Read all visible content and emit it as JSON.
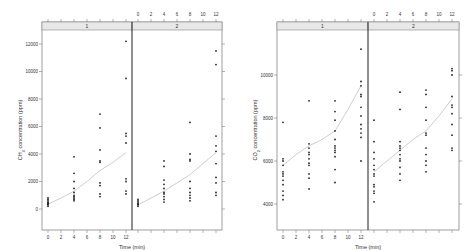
{
  "chart_data": [
    {
      "type": "scatter",
      "title": "",
      "xlabel": "Time (min)",
      "ylabel": "CH4 concentration (ppm)",
      "ylabel_parts": {
        "pre": "CH",
        "sub": "4",
        "post": " concentration (ppm)"
      },
      "ylim": [
        -500,
        13000
      ],
      "xlim": [
        -1,
        13
      ],
      "yticks": [
        0,
        2000,
        4000,
        6000,
        8000,
        10000,
        12000
      ],
      "ytick_labels": [
        "0",
        "2000",
        "4000",
        "6000",
        "8000",
        "10000",
        "12000"
      ],
      "xticks": [
        0,
        2,
        4,
        6,
        8,
        10,
        12
      ],
      "xtick_labels": [
        "0",
        "2",
        "4",
        "6",
        "8",
        "10",
        "12"
      ],
      "grid": false,
      "panels": [
        {
          "strip_label": "1",
          "points": [
            [
              0,
              200
            ],
            [
              0,
              300
            ],
            [
              0,
              400
            ],
            [
              0,
              500
            ],
            [
              0,
              600
            ],
            [
              0,
              700
            ],
            [
              0,
              800
            ],
            [
              0,
              350
            ],
            [
              0,
              450
            ],
            [
              4,
              600
            ],
            [
              4,
              800
            ],
            [
              4,
              1000
            ],
            [
              4,
              1200
            ],
            [
              4,
              1500
            ],
            [
              4,
              2000
            ],
            [
              4,
              2600
            ],
            [
              4,
              3800
            ],
            [
              4,
              700
            ],
            [
              4,
              900
            ],
            [
              8,
              900
            ],
            [
              8,
              1100
            ],
            [
              8,
              1700
            ],
            [
              8,
              1900
            ],
            [
              8,
              3400
            ],
            [
              8,
              3500
            ],
            [
              8,
              4300
            ],
            [
              8,
              5900
            ],
            [
              8,
              6900
            ],
            [
              12,
              1100
            ],
            [
              12,
              1300
            ],
            [
              12,
              2000
            ],
            [
              12,
              2200
            ],
            [
              12,
              4800
            ],
            [
              12,
              5300
            ],
            [
              12,
              5500
            ],
            [
              12,
              9500
            ],
            [
              12,
              12200
            ]
          ],
          "smooth": [
            [
              0,
              350
            ],
            [
              2,
              800
            ],
            [
              4,
              1300
            ],
            [
              6,
              2000
            ],
            [
              8,
              2800
            ],
            [
              10,
              3400
            ],
            [
              12,
              4100
            ]
          ]
        },
        {
          "strip_label": "2",
          "points": [
            [
              0,
              200
            ],
            [
              0,
              300
            ],
            [
              0,
              400
            ],
            [
              0,
              500
            ],
            [
              0,
              600
            ],
            [
              0,
              700
            ],
            [
              0,
              350
            ],
            [
              4,
              500
            ],
            [
              4,
              700
            ],
            [
              4,
              900
            ],
            [
              4,
              1100
            ],
            [
              4,
              1200
            ],
            [
              4,
              1500
            ],
            [
              4,
              1800
            ],
            [
              4,
              2100
            ],
            [
              4,
              3100
            ],
            [
              4,
              3500
            ],
            [
              8,
              600
            ],
            [
              8,
              800
            ],
            [
              8,
              1000
            ],
            [
              8,
              1200
            ],
            [
              8,
              1500
            ],
            [
              8,
              2000
            ],
            [
              8,
              3500
            ],
            [
              8,
              3600
            ],
            [
              8,
              4000
            ],
            [
              8,
              6300
            ],
            [
              12,
              1000
            ],
            [
              12,
              1200
            ],
            [
              12,
              1900
            ],
            [
              12,
              2300
            ],
            [
              12,
              3300
            ],
            [
              12,
              4200
            ],
            [
              12,
              4600
            ],
            [
              12,
              5300
            ],
            [
              12,
              10500
            ],
            [
              12,
              11500
            ]
          ],
          "smooth": [
            [
              0,
              300
            ],
            [
              2,
              800
            ],
            [
              4,
              1300
            ],
            [
              6,
              1900
            ],
            [
              8,
              2500
            ],
            [
              10,
              3300
            ],
            [
              12,
              4100
            ]
          ]
        }
      ]
    },
    {
      "type": "scatter",
      "title": "",
      "xlabel": "Time (min)",
      "ylabel": "CO2 concentration (ppm)",
      "ylabel_parts": {
        "pre": "CO",
        "sub": "2",
        "post": " concentration (ppm)"
      },
      "ylim": [
        3300,
        12000
      ],
      "xlim": [
        -1,
        13
      ],
      "yticks": [
        4000,
        6000,
        8000,
        10000
      ],
      "ytick_labels": [
        "4000",
        "6000",
        "8000",
        "10000"
      ],
      "xticks": [
        0,
        2,
        4,
        6,
        8,
        10,
        12
      ],
      "xtick_labels": [
        "0",
        "2",
        "4",
        "6",
        "8",
        "10",
        "12"
      ],
      "grid": false,
      "panels": [
        {
          "strip_label": "1",
          "points": [
            [
              0,
              4200
            ],
            [
              0,
              4400
            ],
            [
              0,
              4600
            ],
            [
              0,
              4900
            ],
            [
              0,
              5100
            ],
            [
              0,
              5300
            ],
            [
              0,
              5400
            ],
            [
              0,
              5500
            ],
            [
              0,
              5800
            ],
            [
              0,
              6000
            ],
            [
              0,
              6100
            ],
            [
              0,
              7800
            ],
            [
              4,
              4700
            ],
            [
              4,
              5200
            ],
            [
              4,
              5400
            ],
            [
              4,
              5800
            ],
            [
              4,
              5900
            ],
            [
              4,
              6100
            ],
            [
              4,
              6300
            ],
            [
              4,
              6400
            ],
            [
              4,
              6600
            ],
            [
              4,
              6800
            ],
            [
              4,
              8800
            ],
            [
              8,
              5000
            ],
            [
              8,
              5600
            ],
            [
              8,
              6200
            ],
            [
              8,
              6400
            ],
            [
              8,
              6500
            ],
            [
              8,
              6600
            ],
            [
              8,
              6700
            ],
            [
              8,
              7000
            ],
            [
              8,
              7400
            ],
            [
              8,
              7900
            ],
            [
              8,
              8300
            ],
            [
              8,
              8800
            ],
            [
              12,
              6000
            ],
            [
              12,
              7100
            ],
            [
              12,
              7300
            ],
            [
              12,
              7500
            ],
            [
              12,
              7700
            ],
            [
              12,
              8100
            ],
            [
              12,
              8500
            ],
            [
              12,
              9000
            ],
            [
              12,
              9100
            ],
            [
              12,
              9500
            ],
            [
              12,
              9700
            ],
            [
              12,
              11200
            ]
          ],
          "smooth": [
            [
              0,
              5800
            ],
            [
              2,
              6300
            ],
            [
              4,
              6700
            ],
            [
              6,
              7000
            ],
            [
              8,
              7400
            ],
            [
              10,
              8400
            ],
            [
              12,
              9500
            ]
          ]
        },
        {
          "strip_label": "2",
          "points": [
            [
              0,
              4100
            ],
            [
              0,
              4500
            ],
            [
              0,
              4600
            ],
            [
              0,
              4800
            ],
            [
              0,
              4900
            ],
            [
              0,
              5300
            ],
            [
              0,
              5400
            ],
            [
              0,
              5600
            ],
            [
              0,
              5800
            ],
            [
              0,
              6100
            ],
            [
              0,
              6400
            ],
            [
              0,
              6900
            ],
            [
              0,
              7900
            ],
            [
              4,
              5100
            ],
            [
              4,
              5400
            ],
            [
              4,
              5700
            ],
            [
              4,
              6000
            ],
            [
              4,
              6100
            ],
            [
              4,
              6300
            ],
            [
              4,
              6500
            ],
            [
              4,
              6600
            ],
            [
              4,
              6700
            ],
            [
              4,
              6900
            ],
            [
              4,
              8400
            ],
            [
              4,
              9200
            ],
            [
              8,
              5500
            ],
            [
              8,
              5800
            ],
            [
              8,
              6000
            ],
            [
              8,
              6300
            ],
            [
              8,
              6600
            ],
            [
              8,
              7200
            ],
            [
              8,
              7300
            ],
            [
              8,
              7900
            ],
            [
              8,
              8500
            ],
            [
              8,
              9100
            ],
            [
              8,
              9300
            ],
            [
              12,
              6500
            ],
            [
              12,
              6600
            ],
            [
              12,
              7200
            ],
            [
              12,
              7700
            ],
            [
              12,
              8200
            ],
            [
              12,
              8500
            ],
            [
              12,
              8600
            ],
            [
              12,
              9000
            ],
            [
              12,
              10000
            ],
            [
              12,
              10200
            ],
            [
              12,
              10300
            ]
          ],
          "smooth": [
            [
              0,
              5500
            ],
            [
              2,
              6000
            ],
            [
              4,
              6500
            ],
            [
              6,
              7000
            ],
            [
              8,
              7400
            ],
            [
              10,
              8100
            ],
            [
              12,
              8900
            ]
          ]
        }
      ]
    }
  ]
}
